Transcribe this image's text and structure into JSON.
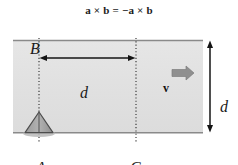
{
  "figure": {
    "caption_formula": "a × b = −a × b",
    "labels": {
      "point_b": "B",
      "point_a": "A",
      "point_c": "C",
      "horizontal_distance": "d",
      "vertical_distance": "d",
      "velocity_vector": "v"
    },
    "colors": {
      "slab_fill": "#e2e2e2",
      "slab_edge": "#7a7a7a",
      "line": "#1a1a1a",
      "velocity_arrow": "#8c8c8c",
      "pivot_fill": "#a8a8a8",
      "pivot_edge": "#4a4a4a",
      "pivot_shadow": "#b4b4b4",
      "background": "#ffffff"
    },
    "geometry": {
      "slab_left": 13,
      "slab_right": 203,
      "slab_top": 20,
      "slab_bottom": 113,
      "line_b_x": 39,
      "line_c_x": 136,
      "dimension_arrow_x": 210
    }
  }
}
